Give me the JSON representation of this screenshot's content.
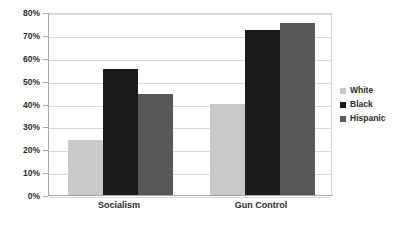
{
  "chart_data": {
    "type": "bar",
    "title": "",
    "subtitle": "",
    "xlabel": "",
    "ylabel": "",
    "categories": [
      "Socialism",
      "Gun Control"
    ],
    "series": [
      {
        "name": "White",
        "values": [
          24,
          40
        ],
        "color": "#c9c9c9"
      },
      {
        "name": "Black",
        "values": [
          55,
          72
        ],
        "color": "#1a1a1a"
      },
      {
        "name": "Hispanic",
        "values": [
          44,
          75
        ],
        "color": "#575757"
      }
    ],
    "ylim": [
      0,
      80
    ],
    "ytick_values": [
      0,
      10,
      20,
      30,
      40,
      50,
      60,
      70,
      80
    ],
    "ytick_labels": [
      "0%",
      "10%",
      "20%",
      "30%",
      "40%",
      "50%",
      "60%",
      "70%",
      "80%"
    ],
    "grid": true,
    "grid_axis": "y",
    "legend_position": "right",
    "legend_entries": [
      "White",
      "Black",
      "Hispanic"
    ],
    "plot_background": "#ffffff",
    "gridline_color": "#d9d9d9",
    "axis_color": "#a6a6a6",
    "text_color": "#2b2b2b"
  }
}
